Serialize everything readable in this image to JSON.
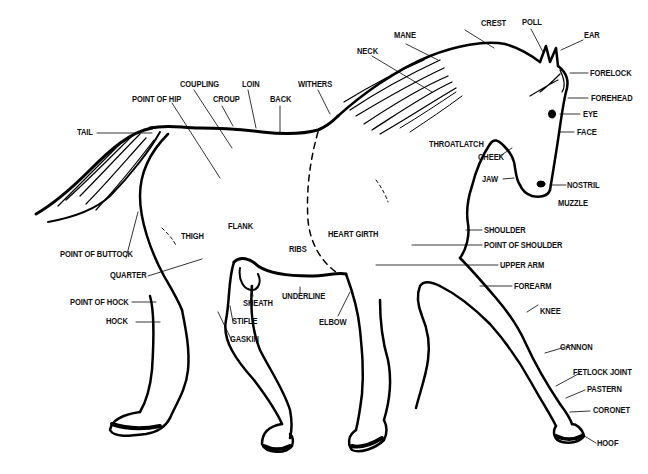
{
  "diagram": {
    "labels": {
      "crest": "CREST",
      "poll": "POLL",
      "mane": "MANE",
      "ear": "EAR",
      "neck": "NECK",
      "forelock": "FORELOCK",
      "coupling": "COUPLING",
      "loin": "LOIN",
      "withers": "WITHERS",
      "point_of_hip": "POINT OF HIP",
      "croup": "CROUP",
      "back": "BACK",
      "forehead": "FOREHEAD",
      "eye": "EYE",
      "tail": "TAIL",
      "face": "FACE",
      "throatlatch": "THROATLATCH",
      "cheek": "CHEEK",
      "jaw": "JAW",
      "nostril": "NOSTRIL",
      "muzzle": "MUZZLE",
      "flank": "FLANK",
      "thigh": "THIGH",
      "heart_girth": "HEART GIRTH",
      "shoulder": "SHOULDER",
      "ribs": "RIBS",
      "point_of_shoulder": "POINT OF SHOULDER",
      "point_of_buttock": "POINT OF BUTTOCK",
      "upper_arm": "UPPER ARM",
      "quarter": "QUARTER",
      "sheath": "SHEATH",
      "forearm": "FOREARM",
      "underline": "UNDERLINE",
      "point_of_hock": "POINT OF HOCK",
      "knee": "KNEE",
      "hock": "HOCK",
      "stifle": "STIFLE",
      "elbow": "ELBOW",
      "gaskin": "GASKIN",
      "cannon": "CANNON",
      "fetlock_joint": "FETLOCK JOINT",
      "pastern": "PASTERN",
      "coronet": "CORONET",
      "hoof": "HOOF"
    }
  }
}
